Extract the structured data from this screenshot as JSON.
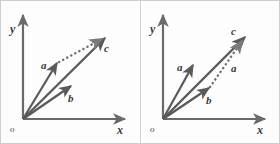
{
  "figure": {
    "background_color": "#fdfdfd",
    "border_color": "#cfcfcf",
    "stroke_color": "#5a5a5a",
    "label_color": "#3a3a3a",
    "width": 280,
    "height": 144
  },
  "panels": [
    {
      "id": "left",
      "name": "panel-left",
      "axes": {
        "x_label": "x",
        "y_label": "y",
        "origin_label": "o"
      },
      "vectors": [
        {
          "name": "a",
          "label": "a",
          "style": "solid",
          "from": [
            22,
            118
          ],
          "to": [
            56,
            62
          ],
          "label_pos": [
            42,
            68
          ]
        },
        {
          "name": "b",
          "label": "b",
          "style": "solid",
          "from": [
            22,
            118
          ],
          "to": [
            70,
            85
          ],
          "label_pos": [
            70,
            99
          ]
        },
        {
          "name": "c",
          "label": "c",
          "style": "solid",
          "from": [
            22,
            118
          ],
          "to": [
            104,
            37
          ],
          "label_pos": [
            104,
            49
          ]
        },
        {
          "name": "b-translated",
          "label": "",
          "style": "dotted",
          "from": [
            56,
            62
          ],
          "to": [
            103,
            36
          ],
          "label_pos": [
            0,
            0
          ]
        }
      ]
    },
    {
      "id": "right",
      "name": "panel-right",
      "axes": {
        "x_label": "x",
        "y_label": "y",
        "origin_label": "o"
      },
      "vectors": [
        {
          "name": "a",
          "label": "a",
          "style": "solid",
          "from": [
            22,
            118
          ],
          "to": [
            52,
            64
          ],
          "label_pos": [
            38,
            70
          ]
        },
        {
          "name": "b",
          "label": "b",
          "style": "solid",
          "from": [
            22,
            118
          ],
          "to": [
            68,
            87
          ],
          "label_pos": [
            68,
            101
          ]
        },
        {
          "name": "c",
          "label": "c",
          "style": "solid",
          "from": [
            22,
            118
          ],
          "to": [
            104,
            36
          ],
          "label_pos": [
            95,
            33
          ]
        },
        {
          "name": "a-translated",
          "label": "a",
          "style": "dotted",
          "from": [
            68,
            87
          ],
          "to": [
            103,
            38
          ],
          "label_pos": [
            92,
            68
          ]
        }
      ]
    }
  ]
}
